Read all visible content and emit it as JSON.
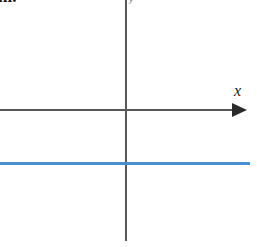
{
  "figure": {
    "caption_fragment": "m.",
    "background_color": "#ffffff"
  },
  "axes": {
    "x_label": "x",
    "y_label": "y",
    "axis_color": "#585858",
    "arrow_color": "#2b2b2b",
    "origin": {
      "x": 126,
      "y": 110
    }
  },
  "chart_data": {
    "type": "line",
    "title": "",
    "xlabel": "x",
    "ylabel": "y",
    "grid": false,
    "legend": null,
    "xlim": [
      -126,
      124
    ],
    "ylim": [
      -131,
      110
    ],
    "series": [
      {
        "name": "horizontal line",
        "color": "#4a8fd4",
        "equation": "y = c (constant, negative)",
        "x": [
          -126,
          124
        ],
        "values": [
          -53,
          -53
        ]
      }
    ],
    "annotations": [
      {
        "text": "x",
        "role": "x-axis-label"
      },
      {
        "text": "y",
        "role": "y-axis-label"
      }
    ]
  }
}
